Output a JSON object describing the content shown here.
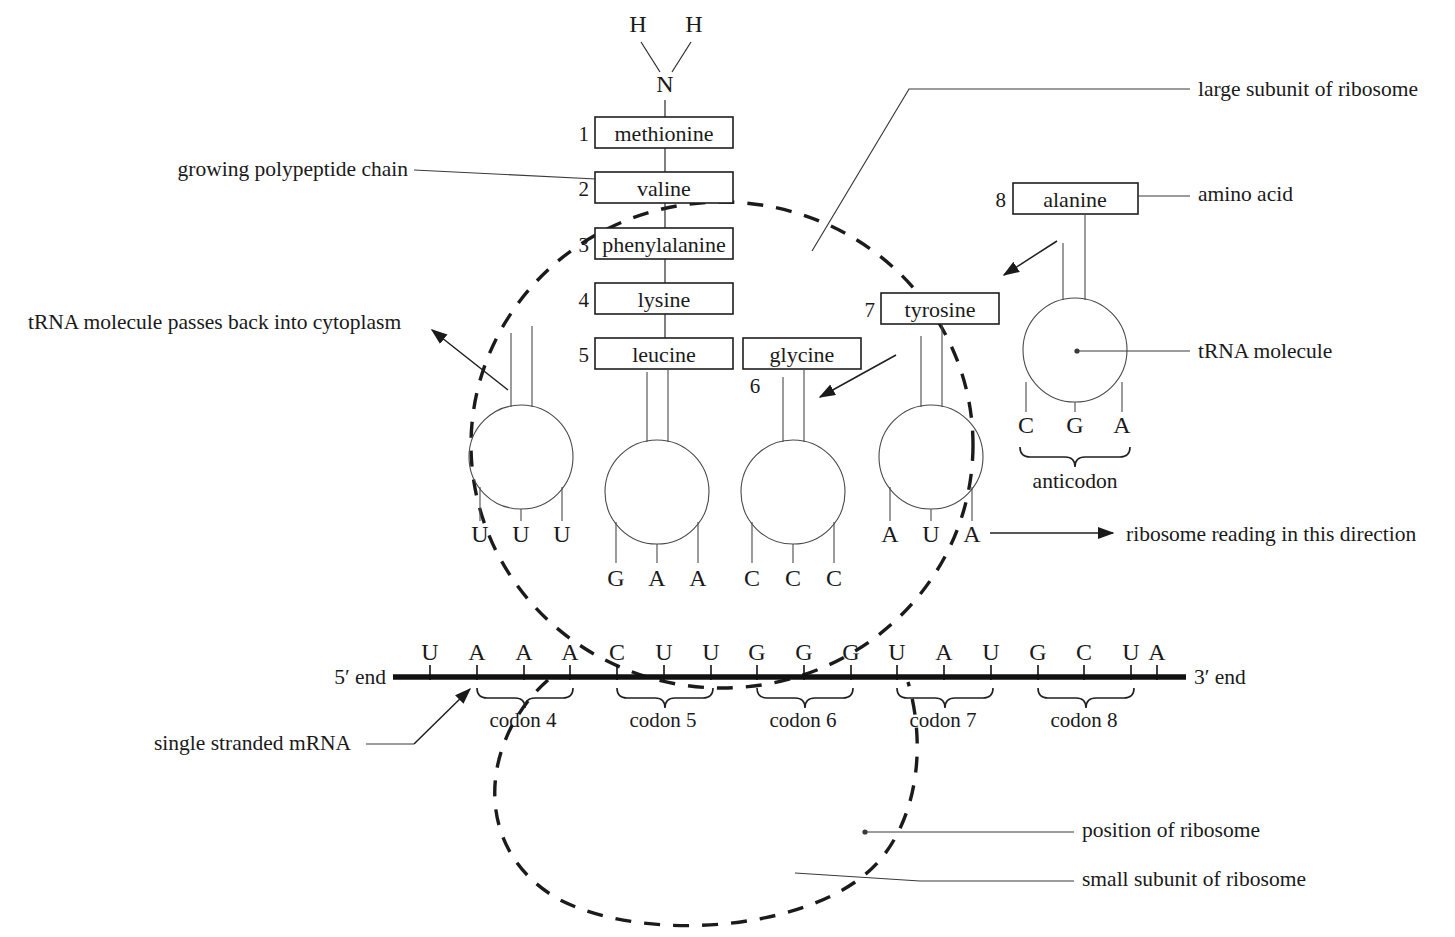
{
  "diagram": {
    "amino_terminus": {
      "h_left": "H",
      "h_right": "H",
      "n": "N"
    },
    "polypeptide": [
      {
        "number": "1",
        "name": "methionine"
      },
      {
        "number": "2",
        "name": "valine"
      },
      {
        "number": "3",
        "name": "phenylalanine"
      },
      {
        "number": "4",
        "name": "lysine"
      },
      {
        "number": "5",
        "name": "leucine"
      }
    ],
    "incoming": [
      {
        "number": "6",
        "name": "glycine"
      },
      {
        "number": "7",
        "name": "tyrosine"
      },
      {
        "number": "8",
        "name": "alanine"
      }
    ],
    "trnas": [
      {
        "id": "trna-exiting",
        "anticodon": [
          "U",
          "U",
          "U"
        ]
      },
      {
        "id": "trna-leucine",
        "anticodon": [
          "G",
          "A",
          "A"
        ]
      },
      {
        "id": "trna-glycine",
        "anticodon": [
          "C",
          "C",
          "C"
        ]
      },
      {
        "id": "trna-tyrosine",
        "anticodon": [
          "A",
          "U",
          "A"
        ]
      },
      {
        "id": "trna-alanine",
        "anticodon": [
          "C",
          "G",
          "A"
        ]
      }
    ],
    "mrna": {
      "five_prime": "5′ end",
      "three_prime": "3′ end",
      "bases": [
        "U",
        "A",
        "A",
        "A",
        "C",
        "U",
        "U",
        "G",
        "G",
        "G",
        "U",
        "A",
        "U",
        "G",
        "C",
        "U",
        "A"
      ],
      "codon_labels": [
        "codon 4",
        "codon 5",
        "codon 6",
        "codon 7",
        "codon 8"
      ]
    },
    "labels": {
      "growing_chain": "growing polypeptide chain",
      "trna_back": "tRNA molecule passes back into cytoplasm",
      "large_subunit": "large subunit of ribosome",
      "amino_acid": "amino acid",
      "trna_molecule": "tRNA molecule",
      "anticodon": "anticodon",
      "reading_direction": "ribosome reading in this direction",
      "single_stranded_mrna": "single stranded mRNA",
      "position_of_ribosome": "position of ribosome",
      "small_subunit": "small subunit of ribosome"
    },
    "colors": {
      "ink": "#1a1a1a",
      "line": "#2b2b2b",
      "page": "#ffffff"
    }
  }
}
